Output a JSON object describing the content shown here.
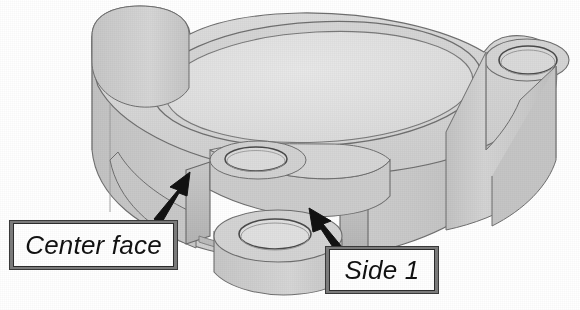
{
  "image": {
    "kind": "technical-illustration",
    "subject": "isometric CAD view of a machined cast housing / flange with a central bore and a front slot",
    "width": 580,
    "height": 310,
    "background_color": "#ffffff",
    "rendering": "grayscale shaded solid, scanned halftone print"
  },
  "callouts": [
    {
      "id": "center-face",
      "label": "Center face",
      "style": "italic",
      "box": {
        "x": 10,
        "y": 221,
        "width": 167,
        "height": 48
      },
      "border_color": "#7c7c7c",
      "text_color": "#111111",
      "arrow": {
        "direction": "up-right",
        "tail": {
          "x": 152,
          "y": 216
        },
        "tip": {
          "x": 186,
          "y": 176
        },
        "color": "#121212",
        "points_to": "vertical left wall of the front slot"
      }
    },
    {
      "id": "side-1",
      "label": "Side 1",
      "style": "italic",
      "box": {
        "x": 326,
        "y": 247,
        "width": 112,
        "height": 46
      },
      "border_color": "#7c7c7c",
      "text_color": "#111111",
      "arrow": {
        "direction": "up-left",
        "tail": {
          "x": 345,
          "y": 251
        },
        "tip": {
          "x": 311,
          "y": 212
        },
        "color": "#121212",
        "points_to": "vertical right wall of the front slot"
      }
    }
  ],
  "part_features": [
    {
      "name": "central-counterbore",
      "description": "large elliptical through-bore in the top face"
    },
    {
      "name": "bolt-hole-boss-top-left",
      "description": "rounded boss with bolt hole, upper left"
    },
    {
      "name": "bolt-hole-boss-right",
      "description": "rounded boss with bolt hole, right side"
    },
    {
      "name": "bolt-hole-boss-front",
      "description": "rounded boss with bolt hole, front lower center"
    },
    {
      "name": "front-slot",
      "description": "rectangular notch cut through the front wall, open to background"
    },
    {
      "name": "center-face",
      "description": "flat vertical face at the left side of the front slot"
    },
    {
      "name": "side-1-face",
      "description": "flat vertical face at the right side of the front slot"
    }
  ],
  "palette": {
    "top_face": "#d8d8d8",
    "bore_floor": "#e3e3e3",
    "outer_wall": "#cfcfcf",
    "outer_wall_shadow": "#bdbdbd",
    "slot_wall_light": "#d2d2d2",
    "slot_wall_dark": "#b6b6b6",
    "edge_line": "#6f6f6f",
    "dark_edge_line": "#4a4a4a",
    "arrow": "#121212",
    "callout_border": "#7c7c7c",
    "background": "#ffffff"
  }
}
